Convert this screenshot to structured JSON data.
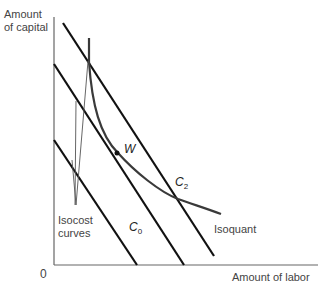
{
  "diagram": {
    "y_axis_label_line1": "Amount",
    "y_axis_label_line2": "of capital",
    "x_axis_label": "Amount of labor",
    "origin_label": "0",
    "point_label": "W",
    "isocost_label_line1": "Isocost",
    "isocost_label_line2": "curves",
    "isoquant_label": "Isoquant",
    "c0_label": "C",
    "c0_sub": "0",
    "c2_label": "C",
    "c2_sub": "2",
    "colors": {
      "line": "#111111",
      "curve": "#3a3a3a",
      "axis": "#555555"
    }
  }
}
